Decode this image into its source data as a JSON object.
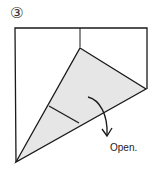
{
  "diagram": {
    "step_number": "③",
    "instruction": "Open.",
    "colors": {
      "fill": "#e6e6e6",
      "line": "#1a1a1a",
      "background": "#ffffff"
    },
    "icons": {
      "arrow": "curved-arrow-down"
    }
  }
}
